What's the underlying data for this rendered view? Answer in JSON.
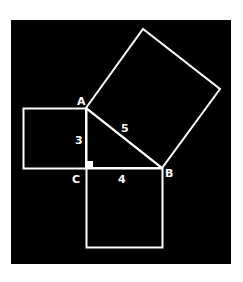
{
  "diagram": {
    "background": "#000000",
    "stroke": "#ffffff",
    "vertices": {
      "A": {
        "label": "A",
        "x": 86,
        "y": 108
      },
      "B": {
        "label": "B",
        "x": 162,
        "y": 168
      },
      "C": {
        "label": "C",
        "x": 86,
        "y": 168
      }
    },
    "side_labels": {
      "AC": "3",
      "CB": "4",
      "AB": "5"
    },
    "squares": [
      {
        "name": "square-on-AC",
        "side": "3"
      },
      {
        "name": "square-on-CB",
        "side": "4"
      },
      {
        "name": "square-on-AB",
        "side": "5"
      }
    ],
    "right_angle_at": "C"
  }
}
